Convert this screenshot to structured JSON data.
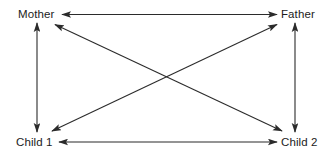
{
  "diagram": {
    "type": "family-interaction-network",
    "background_color": "#ffffff",
    "line_color": "#2b2b2b",
    "text_color": "#1c1c1c",
    "nodes": [
      {
        "id": "mother",
        "label": "Mother",
        "position": "top-left"
      },
      {
        "id": "father",
        "label": "Father",
        "position": "top-right"
      },
      {
        "id": "child1",
        "label": "Child 1",
        "position": "bottom-left"
      },
      {
        "id": "child2",
        "label": "Child 2",
        "position": "bottom-right"
      }
    ],
    "edges": [
      {
        "id": "mother-father",
        "from": "Mother",
        "to": "Father",
        "style": "double-headed",
        "orientation": "horizontal-top"
      },
      {
        "id": "child1-child2",
        "from": "Child 1",
        "to": "Child 2",
        "style": "double-headed",
        "orientation": "horizontal-bottom"
      },
      {
        "id": "mother-child1",
        "from": "Mother",
        "to": "Child 1",
        "style": "double-headed",
        "orientation": "vertical-left"
      },
      {
        "id": "father-child2",
        "from": "Father",
        "to": "Child 2",
        "style": "double-headed",
        "orientation": "vertical-right"
      },
      {
        "id": "mother-child2",
        "from": "Mother",
        "to": "Child 2",
        "style": "double-headed",
        "orientation": "diagonal-descending"
      },
      {
        "id": "father-child1",
        "from": "Father",
        "to": "Child 1",
        "style": "double-headed",
        "orientation": "diagonal-ascending"
      }
    ]
  }
}
